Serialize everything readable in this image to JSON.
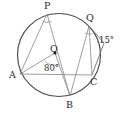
{
  "figure": {
    "background_color": "#ffffff",
    "stroke_color": "#4a4a4a",
    "chord_color": "#8d8d92",
    "label_color": "#2b2b2b",
    "width": 121,
    "height": 116
  },
  "circle": {
    "center_label": "O",
    "center_x": 59,
    "center_y": 55,
    "radius": 42
  },
  "points": [
    {
      "label": "P",
      "x": 47,
      "y": 14,
      "position": "top"
    },
    {
      "label": "Q",
      "x": 89,
      "y": 26,
      "position": "upper-right"
    },
    {
      "label": "C",
      "x": 93,
      "y": 73,
      "position": "right"
    },
    {
      "label": "B",
      "x": 70,
      "y": 96,
      "position": "bottom"
    },
    {
      "label": "A",
      "x": 20,
      "y": 74,
      "position": "left"
    },
    {
      "label": "O",
      "x": 55,
      "y": 53,
      "position": "center"
    }
  ],
  "angles": [
    {
      "label": "80°",
      "vertex": "O",
      "value": 80,
      "unit": "degrees"
    },
    {
      "label": "15°",
      "vertex": "C",
      "value": 15,
      "unit": "degrees"
    }
  ],
  "labels": {
    "P": "P",
    "Q": "Q",
    "C": "C",
    "B": "B",
    "A": "A",
    "O": "O",
    "angle_center": "80°",
    "angle_exterior": "15°"
  },
  "segments": [
    {
      "name": "chord-PA",
      "from": "P",
      "to": "A"
    },
    {
      "name": "chord-PB",
      "from": "P",
      "to": "B"
    },
    {
      "name": "chord-QB",
      "from": "Q",
      "to": "B"
    },
    {
      "name": "chord-QC",
      "from": "Q",
      "to": "C"
    },
    {
      "name": "chord-AC",
      "from": "A",
      "to": "C"
    },
    {
      "name": "radius-OA",
      "from": "O",
      "to": "A"
    },
    {
      "name": "radius-OB",
      "from": "O",
      "to": "B"
    },
    {
      "name": "tangent-at-C",
      "from": "C",
      "to": "exterior"
    }
  ]
}
